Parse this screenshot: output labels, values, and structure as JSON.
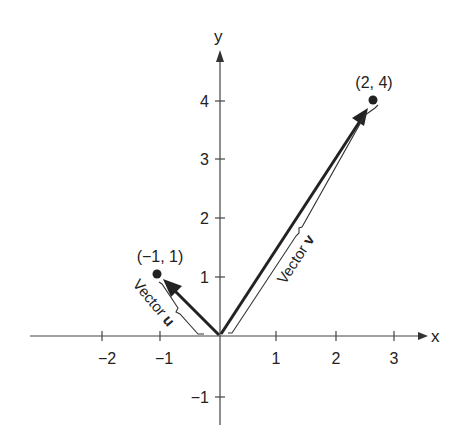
{
  "diagram": {
    "axes": {
      "x_label": "x",
      "y_label": "y",
      "x_ticks": [
        {
          "value": -2,
          "label": "−2"
        },
        {
          "value": -1,
          "label": "−1"
        },
        {
          "value": 1,
          "label": "1"
        },
        {
          "value": 2,
          "label": "2"
        },
        {
          "value": 3,
          "label": "3"
        }
      ],
      "y_ticks": [
        {
          "value": 4,
          "label": "4"
        },
        {
          "value": 3,
          "label": "3"
        },
        {
          "value": 2,
          "label": "2"
        },
        {
          "value": 1,
          "label": "1"
        },
        {
          "value": -1,
          "label": "−1"
        }
      ]
    },
    "vectors": [
      {
        "name": "u",
        "label_prefix": "Vector ",
        "label_bold": "u",
        "tip": [
          -1,
          1
        ],
        "point_label": "(−1, 1)"
      },
      {
        "name": "v",
        "label_prefix": "Vector ",
        "label_bold": "v",
        "tip": [
          2,
          4
        ],
        "point_label": "(2, 4)"
      }
    ],
    "colors": {
      "ink": "#222222",
      "background": "#ffffff"
    }
  }
}
